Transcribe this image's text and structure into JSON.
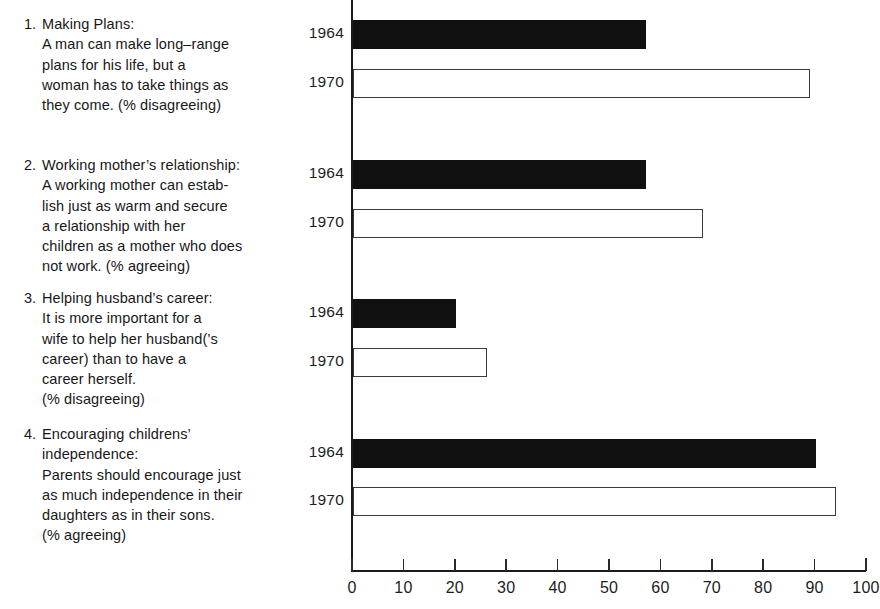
{
  "statements": [
    {
      "number": "1.",
      "lines": [
        "Making Plans:",
        "A man can make long–range",
        "plans for his life, but a",
        "woman has to take things as",
        "they come. (% disagreeing)"
      ]
    },
    {
      "number": "2.",
      "lines": [
        "Working mother’s relationship:",
        "A working mother can estab-",
        "lish just as warm and secure",
        "a relationship with her",
        "children as a mother who does",
        "not work. (% agreeing)"
      ]
    },
    {
      "number": "3.",
      "lines": [
        "Helping husband’s career:",
        "It is more important for a",
        "wife to help her husband(’s",
        "career) than to have a",
        "career herself.",
        "(% disagreeing)"
      ]
    },
    {
      "number": "4.",
      "lines": [
        "Encouraging childrens’",
        "independence:",
        "Parents should encourage just",
        "as much independence in their",
        "daughters as in their sons.",
        "(% agreeing)"
      ]
    }
  ],
  "chart_data": {
    "type": "bar",
    "orientation": "horizontal",
    "title": "",
    "xlabel": "",
    "ylabel": "",
    "xlim": [
      0,
      100
    ],
    "xticks": [
      "0",
      "10",
      "20",
      "30",
      "40",
      "50",
      "60",
      "70",
      "80",
      "90",
      "100"
    ],
    "grid": false,
    "legend": "none",
    "series": [
      {
        "name": "1964",
        "style": "filled",
        "color": "#111111"
      },
      {
        "name": "1970",
        "style": "hollow",
        "color": "#ffffff"
      }
    ],
    "categories": [
      "1. Making Plans",
      "2. Working mother’s relationship",
      "3. Helping husband’s career",
      "4. Encouraging childrens’ independence"
    ],
    "groups": [
      {
        "category": "1. Making Plans",
        "bars": [
          {
            "year": "1964",
            "value": 57,
            "style": "filled"
          },
          {
            "year": "1970",
            "value": 89,
            "style": "hollow"
          }
        ]
      },
      {
        "category": "2. Working mother’s relationship",
        "bars": [
          {
            "year": "1964",
            "value": 57,
            "style": "filled"
          },
          {
            "year": "1970",
            "value": 68,
            "style": "hollow"
          }
        ]
      },
      {
        "category": "3. Helping husband’s career",
        "bars": [
          {
            "year": "1964",
            "value": 20,
            "style": "filled"
          },
          {
            "year": "1970",
            "value": 26,
            "style": "hollow"
          }
        ]
      },
      {
        "category": "4. Encouraging childrens’ independence",
        "bars": [
          {
            "year": "1964",
            "value": 90,
            "style": "filled"
          },
          {
            "year": "1970",
            "value": 94,
            "style": "hollow"
          }
        ]
      }
    ]
  },
  "layout": {
    "statement_tops": [
      14,
      155,
      288,
      424
    ],
    "group_bar_tops": [
      [
        20,
        69
      ],
      [
        160,
        209
      ],
      [
        299,
        348
      ],
      [
        439,
        487
      ]
    ],
    "group_year_tops": [
      [
        24,
        73
      ],
      [
        164,
        213
      ],
      [
        303,
        352
      ],
      [
        443,
        491
      ]
    ],
    "bar_height": 29,
    "axis_x0": 352,
    "axis_x100": 866
  }
}
